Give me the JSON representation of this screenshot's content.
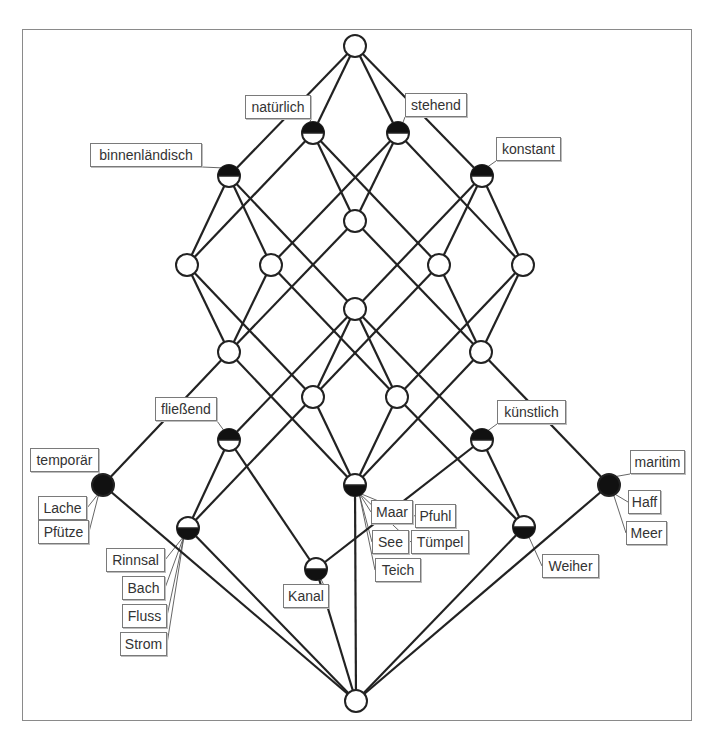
{
  "diagram": {
    "type": "concept-lattice",
    "frame": {
      "x": 22,
      "y": 29,
      "w": 670,
      "h": 692
    },
    "colors": {
      "edge": "#222222",
      "node_fill": "#ffffff",
      "node_filled": "#111111",
      "label_border": "#7a7a7a"
    },
    "nodes": [
      {
        "id": "top",
        "x": 355,
        "y": 46,
        "fill": "none"
      },
      {
        "id": "N",
        "x": 313,
        "y": 133,
        "fill": "top"
      },
      {
        "id": "S",
        "x": 398,
        "y": 133,
        "fill": "top"
      },
      {
        "id": "B",
        "x": 229,
        "y": 176,
        "fill": "top"
      },
      {
        "id": "K",
        "x": 482,
        "y": 176,
        "fill": "top"
      },
      {
        "id": "C1",
        "x": 355,
        "y": 221,
        "fill": "none"
      },
      {
        "id": "A1",
        "x": 187,
        "y": 265,
        "fill": "none"
      },
      {
        "id": "A2",
        "x": 271,
        "y": 265,
        "fill": "none"
      },
      {
        "id": "A3",
        "x": 439,
        "y": 265,
        "fill": "none"
      },
      {
        "id": "A4",
        "x": 523,
        "y": 265,
        "fill": "none"
      },
      {
        "id": "C2",
        "x": 355,
        "y": 309,
        "fill": "none"
      },
      {
        "id": "D1",
        "x": 229,
        "y": 352,
        "fill": "none"
      },
      {
        "id": "D2",
        "x": 481,
        "y": 352,
        "fill": "none"
      },
      {
        "id": "E1",
        "x": 313,
        "y": 397,
        "fill": "none"
      },
      {
        "id": "E2",
        "x": 397,
        "y": 397,
        "fill": "none"
      },
      {
        "id": "F",
        "x": 229,
        "y": 440,
        "fill": "top"
      },
      {
        "id": "KU",
        "x": 482,
        "y": 440,
        "fill": "top"
      },
      {
        "id": "T",
        "x": 103,
        "y": 485,
        "fill": "full"
      },
      {
        "id": "G",
        "x": 355,
        "y": 485,
        "fill": "bottom"
      },
      {
        "id": "M",
        "x": 609,
        "y": 485,
        "fill": "full"
      },
      {
        "id": "R",
        "x": 188,
        "y": 528,
        "fill": "bottom"
      },
      {
        "id": "W",
        "x": 524,
        "y": 527,
        "fill": "bottom"
      },
      {
        "id": "KA",
        "x": 316,
        "y": 569,
        "fill": "bottom"
      },
      {
        "id": "bot",
        "x": 356,
        "y": 701,
        "fill": "none"
      }
    ],
    "edges": [
      [
        "top",
        "N"
      ],
      [
        "top",
        "S"
      ],
      [
        "top",
        "B"
      ],
      [
        "top",
        "K"
      ],
      [
        "N",
        "A1"
      ],
      [
        "N",
        "C1"
      ],
      [
        "N",
        "A3"
      ],
      [
        "S",
        "A2"
      ],
      [
        "S",
        "C1"
      ],
      [
        "S",
        "A4"
      ],
      [
        "B",
        "A1"
      ],
      [
        "B",
        "A2"
      ],
      [
        "B",
        "C2"
      ],
      [
        "K",
        "A3"
      ],
      [
        "K",
        "A4"
      ],
      [
        "K",
        "C2"
      ],
      [
        "C1",
        "D1"
      ],
      [
        "C1",
        "D2"
      ],
      [
        "A1",
        "D1"
      ],
      [
        "A1",
        "E1"
      ],
      [
        "A2",
        "D1"
      ],
      [
        "A2",
        "E2"
      ],
      [
        "A3",
        "D2"
      ],
      [
        "A3",
        "E1"
      ],
      [
        "A4",
        "D2"
      ],
      [
        "A4",
        "E2"
      ],
      [
        "C2",
        "E1"
      ],
      [
        "C2",
        "E2"
      ],
      [
        "C2",
        "F"
      ],
      [
        "C2",
        "KU"
      ],
      [
        "D1",
        "T"
      ],
      [
        "D1",
        "G"
      ],
      [
        "D2",
        "M"
      ],
      [
        "D2",
        "G"
      ],
      [
        "E1",
        "R"
      ],
      [
        "E1",
        "G"
      ],
      [
        "E2",
        "G"
      ],
      [
        "E2",
        "W"
      ],
      [
        "F",
        "R"
      ],
      [
        "F",
        "KA"
      ],
      [
        "KU",
        "KA"
      ],
      [
        "KU",
        "W"
      ],
      [
        "T",
        "bot"
      ],
      [
        "R",
        "bot"
      ],
      [
        "G",
        "bot"
      ],
      [
        "M",
        "bot"
      ],
      [
        "W",
        "bot"
      ],
      [
        "KA",
        "bot"
      ]
    ],
    "attribute_labels": [
      {
        "text": "natürlich",
        "node": "N",
        "x": 245,
        "y": 95,
        "w": 66
      },
      {
        "text": "stehend",
        "node": "S",
        "x": 405,
        "y": 93,
        "w": 62
      },
      {
        "text": "binnenländisch",
        "node": "B",
        "x": 90,
        "y": 143,
        "w": 112
      },
      {
        "text": "konstant",
        "node": "K",
        "x": 496,
        "y": 137,
        "w": 65
      },
      {
        "text": "fließend",
        "node": "F",
        "x": 155,
        "y": 397,
        "w": 62
      },
      {
        "text": "künstlich",
        "node": "KU",
        "x": 497,
        "y": 400,
        "w": 69
      },
      {
        "text": "temporär",
        "node": "T",
        "x": 30,
        "y": 448,
        "w": 69
      },
      {
        "text": "maritim",
        "node": "M",
        "x": 630,
        "y": 450,
        "w": 55
      }
    ],
    "object_labels": [
      {
        "text": "Lache",
        "node": "T",
        "x": 38,
        "y": 496,
        "w": 49
      },
      {
        "text": "Pfütze",
        "node": "T",
        "x": 38,
        "y": 520,
        "w": 51
      },
      {
        "text": "Rinnsal",
        "node": "R",
        "x": 106,
        "y": 548,
        "w": 59
      },
      {
        "text": "Bach",
        "node": "R",
        "x": 122,
        "y": 576,
        "w": 43
      },
      {
        "text": "Fluss",
        "node": "R",
        "x": 122,
        "y": 604,
        "w": 45
      },
      {
        "text": "Strom",
        "node": "R",
        "x": 120,
        "y": 632,
        "w": 47
      },
      {
        "text": "Kanal",
        "node": "KA",
        "x": 283,
        "y": 584,
        "w": 46
      },
      {
        "text": "Maar",
        "node": "G",
        "x": 371,
        "y": 500,
        "w": 42
      },
      {
        "text": "Pfuhl",
        "node": "G",
        "x": 415,
        "y": 504,
        "w": 41
      },
      {
        "text": "See",
        "node": "G",
        "x": 372,
        "y": 530,
        "w": 37
      },
      {
        "text": "Tümpel",
        "node": "G",
        "x": 411,
        "y": 530,
        "w": 58
      },
      {
        "text": "Teich",
        "node": "G",
        "x": 375,
        "y": 558,
        "w": 46
      },
      {
        "text": "Weiher",
        "node": "W",
        "x": 542,
        "y": 554,
        "w": 57
      },
      {
        "text": "Haff",
        "node": "M",
        "x": 628,
        "y": 490,
        "w": 33
      },
      {
        "text": "Meer",
        "node": "M",
        "x": 626,
        "y": 521,
        "w": 41
      }
    ]
  }
}
